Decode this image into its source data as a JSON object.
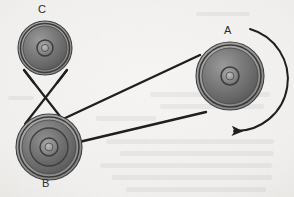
{
  "diagram": {
    "type": "mechanical-pulley-belt-diagram",
    "medium": "scanned textbook figure",
    "background_color": "#f2f1ef",
    "ink_color": "#1f1f1f",
    "canvas": {
      "width": 294,
      "height": 197
    }
  },
  "labels": {
    "a": "A",
    "b": "B",
    "c": "C"
  },
  "pulleys": [
    {
      "id": "A",
      "label": "A",
      "role": "driver",
      "center": {
        "x": 230,
        "y": 76
      },
      "outer_radius": 34,
      "rim_radius": 31,
      "face_radius": 28,
      "hub_outer_radius": 9,
      "hub_inner_radius": 4,
      "fill": "#6e6e6e",
      "rim_fill": "#8a8a8a",
      "edge_color": "#3a3a3a",
      "stepped": false,
      "label_position": {
        "x": 224,
        "y": 25
      }
    },
    {
      "id": "B",
      "label": "B",
      "role": "compound-intermediate",
      "center": {
        "x": 49,
        "y": 147
      },
      "outer_radius": 33,
      "rim_radius": 30,
      "face_radius": 27,
      "step_radius": 19,
      "hub_outer_radius": 9,
      "hub_inner_radius": 4,
      "fill": "#6e6e6e",
      "rim_fill": "#8a8a8a",
      "edge_color": "#3a3a3a",
      "stepped": true,
      "label_position": {
        "x": 42,
        "y": 178
      }
    },
    {
      "id": "C",
      "label": "C",
      "role": "driven",
      "center": {
        "x": 45,
        "y": 48
      },
      "outer_radius": 27,
      "rim_radius": 24.5,
      "face_radius": 22,
      "hub_outer_radius": 8,
      "hub_inner_radius": 3.5,
      "fill": "#6e6e6e",
      "rim_fill": "#8a8a8a",
      "edge_color": "#3a3a3a",
      "stepped": false,
      "label_position": {
        "x": 38,
        "y": 4
      }
    }
  ],
  "belts": [
    {
      "id": "belt-cb",
      "name": "crossed belt C to B",
      "connects": [
        "C",
        "B"
      ],
      "crossed": true,
      "crossing_point": {
        "x": 45,
        "y": 96
      },
      "stroke_width": 2.2,
      "color": "#1f1f1f",
      "segments": [
        {
          "from": {
            "x": 24,
            "y": 70
          },
          "to": {
            "x": 66,
            "y": 124
          }
        },
        {
          "from": {
            "x": 67,
            "y": 70
          },
          "to": {
            "x": 25,
            "y": 124
          }
        }
      ]
    },
    {
      "id": "belt-ab",
      "name": "crossed belt A to B inner sheave",
      "connects": [
        "A",
        "B"
      ],
      "crossed": true,
      "crossing_point": {
        "x": 107,
        "y": 123
      },
      "stroke_width": 2.4,
      "color": "#1f1f1f",
      "segments": [
        {
          "from": {
            "x": 199,
            "y": 56
          },
          "to": {
            "x": 32,
            "y": 134
          }
        },
        {
          "from": {
            "x": 205,
            "y": 112
          },
          "to": {
            "x": 60,
            "y": 146
          }
        }
      ]
    }
  ],
  "rotation_arrow": {
    "name": "rotation-direction-arrow",
    "applies_to": "A",
    "direction": "clockwise",
    "start": {
      "x": 250,
      "y": 29
    },
    "end": {
      "x": 234,
      "y": 131
    },
    "stroke_width": 2.0,
    "color": "#1f1f1f",
    "arrowhead_at": "end"
  },
  "background_artifacts": {
    "description": "faint show-through of printed text from the reverse page",
    "opacity": 0.07,
    "ghost_lines": [
      {
        "x": 106,
        "y": 139,
        "width": 168,
        "height": 5
      },
      {
        "x": 120,
        "y": 151,
        "width": 154,
        "height": 5
      },
      {
        "x": 100,
        "y": 163,
        "width": 172,
        "height": 5
      },
      {
        "x": 112,
        "y": 175,
        "width": 160,
        "height": 5
      },
      {
        "x": 126,
        "y": 187,
        "width": 140,
        "height": 5
      },
      {
        "x": 150,
        "y": 92,
        "width": 120,
        "height": 5
      },
      {
        "x": 160,
        "y": 104,
        "width": 104,
        "height": 5
      },
      {
        "x": 96,
        "y": 116,
        "width": 60,
        "height": 5
      }
    ]
  }
}
